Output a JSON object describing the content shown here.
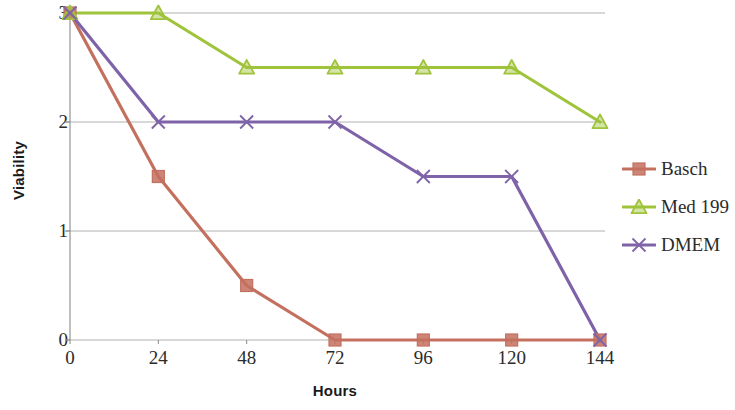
{
  "chart_data": {
    "type": "line",
    "title": "",
    "subtitle": "",
    "xlabel": "Hours",
    "ylabel": "Viability",
    "categories": [
      "0",
      "24",
      "48",
      "72",
      "96",
      "120",
      "144"
    ],
    "x": [
      0,
      24,
      48,
      72,
      96,
      120,
      144
    ],
    "xlim": [
      0,
      144
    ],
    "ylim": [
      0,
      3
    ],
    "yticks": [
      "3",
      "2",
      "1",
      "0"
    ],
    "ytick_values": [
      3,
      2,
      1,
      0
    ],
    "grid": "horizontal",
    "legend_position": "right",
    "series": [
      {
        "name": "Basch",
        "color": "#C4705F",
        "marker": "square",
        "values": [
          3,
          1.5,
          0.5,
          0,
          0,
          0,
          0
        ]
      },
      {
        "name": "Med 199",
        "color": "#9FC43C",
        "marker": "triangle",
        "values": [
          3,
          3,
          2.5,
          2.5,
          2.5,
          2.5,
          2
        ]
      },
      {
        "name": "DMEM",
        "color": "#7F63A8",
        "marker": "x",
        "values": [
          3,
          2,
          2,
          2,
          1.5,
          1.5,
          0
        ]
      }
    ]
  },
  "axis": {
    "y_title": "Viability",
    "x_title": "Hours"
  },
  "legend": {
    "items": [
      {
        "label": "Basch"
      },
      {
        "label": "Med 199"
      },
      {
        "label": "DMEM"
      }
    ]
  },
  "colors": {
    "basch": "#C4705F",
    "med199": "#9FC43C",
    "dmem": "#7F63A8",
    "gridline": "#9a9a9a",
    "axis": "#8a8a8a",
    "text": "#2b2b2b"
  }
}
